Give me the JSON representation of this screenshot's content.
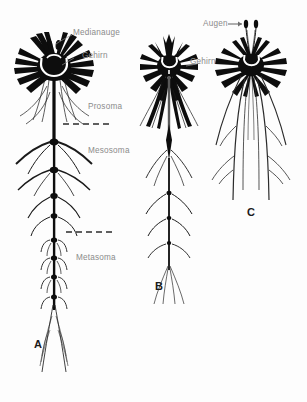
{
  "figure": {
    "background_color": "#fdfdfd",
    "ink_color": "#0d0d0d",
    "label_color": "#8b8b8b",
    "panel_letter_color": "#1a1a1a",
    "labels": {
      "medianauge": "Medianauge",
      "gehirn_a": "Gehirn",
      "prosoma": "Prosoma",
      "mesosoma": "Mesosoma",
      "metasoma": "Metasoma",
      "gehirn_b": "Gehirn",
      "augen": "Augen"
    },
    "panels": [
      {
        "letter": "A",
        "brain": "radial-brain-with-esophageal-ring",
        "median_eyes": 2,
        "nerve_cord": "long-segmented-ventral-nerve-cord",
        "ganglia_count": 12,
        "regions": [
          "Prosoma",
          "Mesosoma",
          "Metasoma"
        ],
        "dashed_dividers": 2
      },
      {
        "letter": "B",
        "brain": "compact-crowned-brain-with-esophageal-ring",
        "nerve_cord": "short-segmented-ventral-nerve-cord-with-spindle-ganglion",
        "ganglia_count": 5,
        "dashed_dividers": 0
      },
      {
        "letter": "C",
        "brain": "starburst-brain-with-esophageal-ring",
        "eyes_on_stalks": 2,
        "nerve_cord": "paired-long-descending-nerve-trunks",
        "ganglia_count": 0,
        "dashed_dividers": 0
      }
    ]
  }
}
